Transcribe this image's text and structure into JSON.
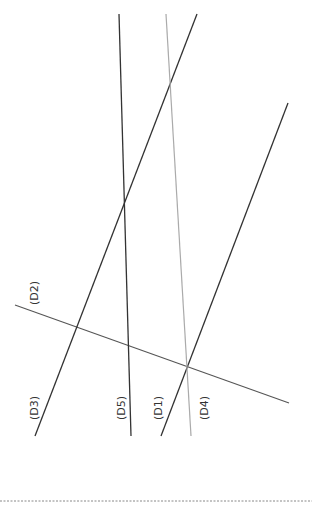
{
  "diagram": {
    "lines": [
      {
        "id": "D1",
        "x1": 288,
        "y1": 103,
        "x2": 161,
        "y2": 436,
        "color": "#333333",
        "width": 1.3
      },
      {
        "id": "D2",
        "x1": 15,
        "y1": 305,
        "x2": 289,
        "y2": 403,
        "color": "#555555",
        "width": 1.1
      },
      {
        "id": "D3",
        "x1": 197,
        "y1": 14,
        "x2": 35,
        "y2": 436,
        "color": "#333333",
        "width": 1.3
      },
      {
        "id": "D4",
        "x1": 166,
        "y1": 14,
        "x2": 191,
        "y2": 436,
        "color": "#aaaaaa",
        "width": 1.2
      },
      {
        "id": "D5",
        "x1": 119,
        "y1": 14,
        "x2": 131,
        "y2": 436,
        "color": "#333333",
        "width": 1.3
      }
    ],
    "labels": [
      {
        "text": "(D2)",
        "x": 38,
        "y": 305
      },
      {
        "text": "(D3)",
        "x": 38,
        "y": 420
      },
      {
        "text": "(D5)",
        "x": 125,
        "y": 420
      },
      {
        "text": "(D1)",
        "x": 162,
        "y": 420
      },
      {
        "text": "(D4)",
        "x": 208,
        "y": 420
      }
    ],
    "baseline": {
      "y": 501,
      "color": "#888888"
    }
  }
}
